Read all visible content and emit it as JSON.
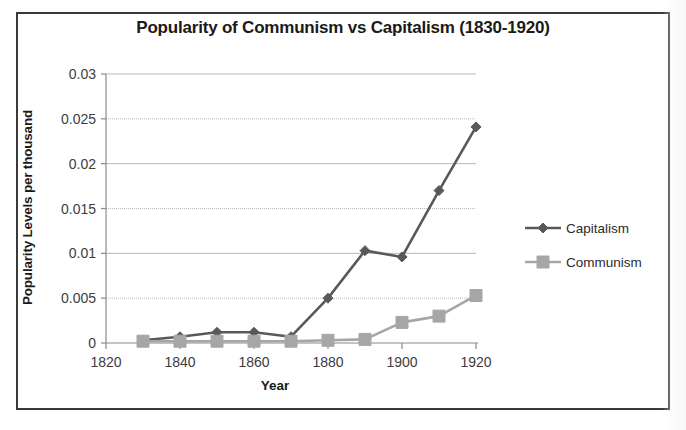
{
  "chart_data": {
    "type": "line",
    "title": "Popularity of Communism vs Capitalism (1830-1920)",
    "xlabel": "Year",
    "ylabel": "Popularity Levels per thousand",
    "x": [
      1830,
      1840,
      1850,
      1860,
      1870,
      1880,
      1890,
      1900,
      1910,
      1920
    ],
    "series": [
      {
        "name": "Capitalism",
        "color": "#595959",
        "marker": "diamond",
        "values": [
          0.0003,
          0.0007,
          0.0012,
          0.0012,
          0.0007,
          0.005,
          0.0103,
          0.0096,
          0.017,
          0.0241
        ]
      },
      {
        "name": "Communism",
        "color": "#a6a6a6",
        "marker": "square",
        "values": [
          0.0002,
          0.0002,
          0.0002,
          0.0002,
          0.0002,
          0.0003,
          0.0004,
          0.0023,
          0.003,
          0.0053
        ]
      }
    ],
    "xlim": [
      1820,
      1920
    ],
    "ylim": [
      0,
      0.03
    ],
    "xticks": [
      1820,
      1840,
      1860,
      1880,
      1900,
      1920
    ],
    "xtick_labels": [
      "1820",
      "1840",
      "1860",
      "1880",
      "1900",
      "1920"
    ],
    "yticks": [
      0,
      0.005,
      0.01,
      0.015,
      0.02,
      0.025,
      0.03
    ],
    "ytick_labels": [
      "0",
      "0.005",
      "0.01",
      "0.015",
      "0.02",
      "0.025",
      "0.03"
    ],
    "grid": true,
    "legend_position": "right"
  }
}
